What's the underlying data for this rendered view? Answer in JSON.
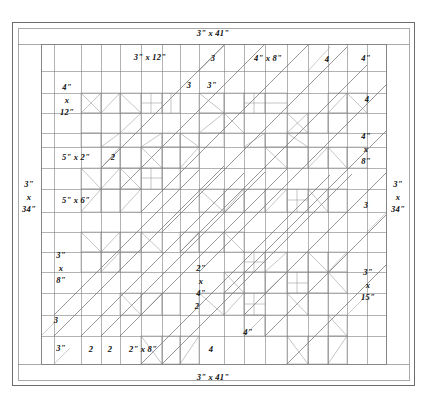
{
  "document": {
    "type": "quilt-piecing-diagram",
    "caption_top": "",
    "ink_color": "#555555",
    "label_color": "#0d0d0d",
    "background": "#ffffff"
  },
  "borders": {
    "top": "3\" x 41\"",
    "bottom": "3\" x 41\"",
    "left": "3\"\nx\n34\"",
    "left_lines": [
      "3\"",
      "x",
      "34\""
    ],
    "right_lines": [
      "3\"",
      "x",
      "34\""
    ]
  },
  "labels": [
    {
      "id": "border-top",
      "text": "3\" x 41\"",
      "x": 213,
      "y": 33
    },
    {
      "id": "border-bottom",
      "text": "3\" x 41\"",
      "x": 213,
      "y": 377
    },
    {
      "id": "sash-3x12",
      "text": "3\" x 12\"",
      "x": 150,
      "y": 57
    },
    {
      "id": "sash-top-3",
      "text": "3",
      "x": 213,
      "y": 58
    },
    {
      "id": "sash-4x8-top",
      "text": "4\" x 8\"",
      "x": 268,
      "y": 58
    },
    {
      "id": "sash-top-4a",
      "text": "4",
      "x": 327,
      "y": 59
    },
    {
      "id": "sash-top-4b",
      "text": "4\"",
      "x": 366,
      "y": 58
    },
    {
      "id": "sash-4x12",
      "lines": [
        "4\"",
        "x",
        "12\""
      ],
      "x": 67,
      "y": 100
    },
    {
      "id": "sash-row2-3a",
      "text": "3",
      "x": 189,
      "y": 85
    },
    {
      "id": "sash-row2-3b",
      "text": "3\"",
      "x": 212,
      "y": 85
    },
    {
      "id": "sash-row2-4",
      "text": "4",
      "x": 367,
      "y": 99
    },
    {
      "id": "sash-5x2",
      "text": "5\" x 2\"",
      "x": 76,
      "y": 157
    },
    {
      "id": "sash-2-left",
      "text": "2",
      "x": 113,
      "y": 157
    },
    {
      "id": "sash-5x6",
      "text": "5\" x 6\"",
      "x": 76,
      "y": 200
    },
    {
      "id": "sash-4x8-right",
      "lines": [
        "4\"",
        "x",
        "8\""
      ],
      "x": 366,
      "y": 149
    },
    {
      "id": "border-left",
      "lines": [
        "3\"",
        "x",
        "34\""
      ],
      "x": 29,
      "y": 197
    },
    {
      "id": "border-right",
      "lines": [
        "3\"",
        "x",
        "34\""
      ],
      "x": 398,
      "y": 197
    },
    {
      "id": "sash-right-3",
      "text": "3",
      "x": 366,
      "y": 205
    },
    {
      "id": "sash-3x8",
      "lines": [
        "3\"",
        "x",
        "8\""
      ],
      "x": 61,
      "y": 268
    },
    {
      "id": "sash-2x4",
      "lines": [
        "2\"",
        "x",
        "4\""
      ],
      "x": 201,
      "y": 281
    },
    {
      "id": "sash-2-mid",
      "text": "2",
      "x": 197,
      "y": 306
    },
    {
      "id": "sash-3x15",
      "lines": [
        "3\"",
        "x",
        "15\""
      ],
      "x": 368,
      "y": 285
    },
    {
      "id": "sash-left-3",
      "text": "3",
      "x": 56,
      "y": 320
    },
    {
      "id": "sash-bot-3",
      "text": "3\"",
      "x": 61,
      "y": 348
    },
    {
      "id": "sash-bot-2a",
      "text": "2",
      "x": 91,
      "y": 349
    },
    {
      "id": "sash-bot-2b",
      "text": "2",
      "x": 110,
      "y": 349
    },
    {
      "id": "sash-2x8",
      "text": "2\" x 8\"",
      "x": 143,
      "y": 349
    },
    {
      "id": "sash-bot-4a",
      "text": "4",
      "x": 211,
      "y": 349
    },
    {
      "id": "sash-bot-4b",
      "text": "4\"",
      "x": 248,
      "y": 332
    }
  ],
  "measurements_list": [
    "3\" x 41\"",
    "3\" x 34\"",
    "3\" x 12\"",
    "4\" x 12\"",
    "4\" x 8\"",
    "5\" x 2\"",
    "5\" x 6\"",
    "3\" x 8\"",
    "3\" x 15\"",
    "2\" x 4\"",
    "2\" x 8\""
  ]
}
